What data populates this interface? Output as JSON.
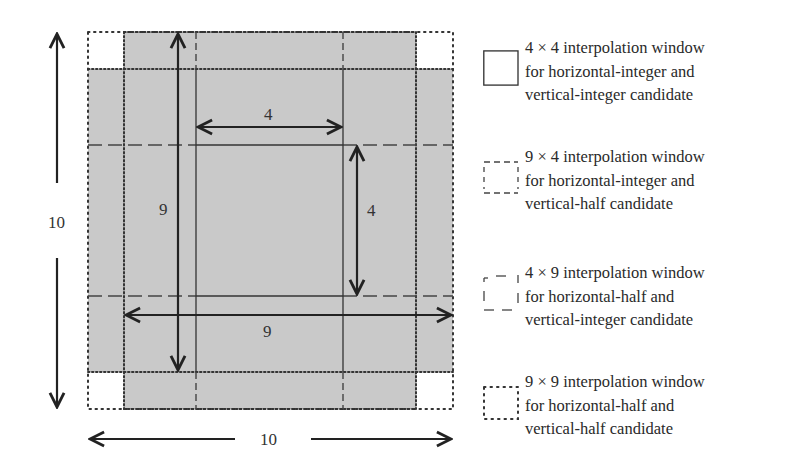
{
  "diagram": {
    "colors": {
      "shade": "#c9c9c9",
      "line": "#2b2b2b",
      "background": "#ffffff"
    },
    "dimension_labels": {
      "outer_height": "10",
      "outer_width": "10",
      "inner_h_span": "4",
      "inner_v_span": "4",
      "nine_vertical": "9",
      "nine_horizontal": "9"
    },
    "grid": {
      "outer": {
        "left": 88,
        "top": 32,
        "right": 453,
        "bottom": 409
      },
      "inner_cols": [
        124,
        196,
        343,
        416
      ],
      "inner_rows": [
        69,
        145,
        296,
        372
      ]
    }
  },
  "legend": {
    "items": [
      {
        "style": "solid",
        "lines": [
          "4 × 4 interpolation window",
          "for horizontal-integer and",
          "vertical-integer candidate"
        ]
      },
      {
        "style": "dashed-short",
        "lines": [
          "9 × 4 interpolation window",
          "for horizontal-integer and",
          "vertical-half candidate"
        ]
      },
      {
        "style": "dashed-long",
        "lines": [
          "4 × 9 interpolation window",
          "for horizontal-half and",
          "vertical-integer candidate"
        ]
      },
      {
        "style": "dotted",
        "lines": [
          "9 × 9 interpolation window",
          "for horizontal-half and",
          "vertical-half candidate"
        ]
      }
    ]
  }
}
